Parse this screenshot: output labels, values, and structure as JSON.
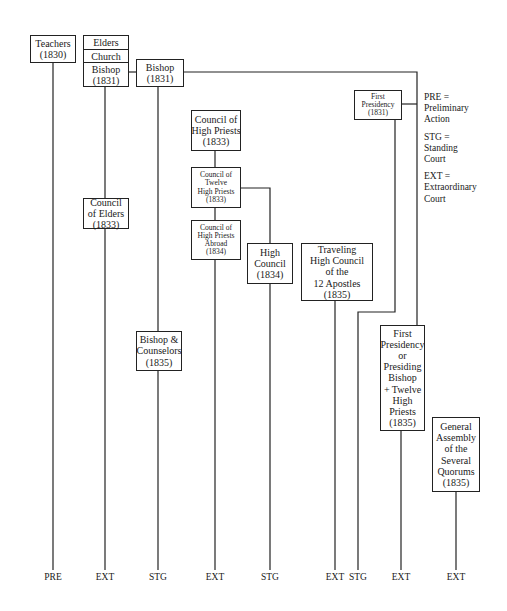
{
  "nodes": {
    "teachers": {
      "lines": [
        "Teachers",
        "(1830)"
      ]
    },
    "stack": {
      "elders": "Elders",
      "church": "Church",
      "bishop_lines": [
        "Bishop",
        "(1831)"
      ]
    },
    "bishop_1831": {
      "lines": [
        "Bishop",
        "(1831)"
      ]
    },
    "council_high_priests": {
      "lines": [
        "Council of",
        "High Priests",
        "(1833)"
      ]
    },
    "council_twelve_high_priests": {
      "lines": [
        "Council of",
        "Twelve",
        "High Priests",
        "(1833)"
      ]
    },
    "council_high_priests_abroad": {
      "lines": [
        "Council of",
        "High Priests",
        "Abroad",
        "(1834)"
      ]
    },
    "council_of_elders": {
      "lines": [
        "Council",
        "of Elders",
        "(1833)"
      ]
    },
    "high_council": {
      "lines": [
        "High",
        "Council",
        "(1834)"
      ]
    },
    "traveling_high_council": {
      "lines": [
        "Traveling",
        "High Council",
        "of the",
        "12 Apostles",
        "(1835)"
      ]
    },
    "first_presidency_1831": {
      "lines": [
        "First",
        "Presidency",
        "(1831)"
      ]
    },
    "bishop_counselors": {
      "lines": [
        "Bishop &",
        "Counselors",
        "(1835)"
      ]
    },
    "first_presidency_or_presiding_bishop": {
      "lines": [
        "First",
        "Presidency",
        "or",
        "Presiding",
        "Bishop",
        "+ Twelve",
        "High",
        "Priests",
        "(1835)"
      ]
    },
    "general_assembly": {
      "lines": [
        "General",
        "Assembly",
        "of the",
        "Several",
        "Quorums",
        "(1835)"
      ]
    }
  },
  "legend": [
    {
      "abbr": "PRE =",
      "lines": [
        "Preliminary",
        "Action"
      ]
    },
    {
      "abbr": "STG =",
      "lines": [
        "Standing",
        "Court"
      ]
    },
    {
      "abbr": "EXT =",
      "lines": [
        "Extraordinary",
        "Court"
      ]
    }
  ],
  "bottom_labels": [
    {
      "x": 53,
      "label": "PRE"
    },
    {
      "x": 105,
      "label": "EXT"
    },
    {
      "x": 158,
      "label": "STG"
    },
    {
      "x": 215,
      "label": "EXT"
    },
    {
      "x": 270,
      "label": "STG"
    },
    {
      "x": 335,
      "label": "EXT"
    },
    {
      "x": 358,
      "label": "STG"
    },
    {
      "x": 401,
      "label": "EXT"
    },
    {
      "x": 456,
      "label": "EXT"
    }
  ]
}
